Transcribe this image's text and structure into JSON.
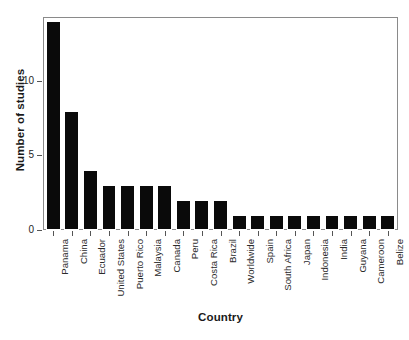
{
  "chart_data": {
    "type": "bar",
    "title": "",
    "xlabel": "Country",
    "ylabel": "Number of studies",
    "categories": [
      "Panama",
      "China",
      "Ecuador",
      "United States",
      "Puerto Rico",
      "Malaysia",
      "Canada",
      "Peru",
      "Costa Rica",
      "Brazil",
      "Worldwide",
      "Spain",
      "South Africa",
      "Japan",
      "Indonesia",
      "India",
      "Guyana",
      "Cameroon",
      "Belize"
    ],
    "values": [
      14,
      8,
      4,
      3,
      3,
      3,
      3,
      2,
      2,
      2,
      1,
      1,
      1,
      1,
      1,
      1,
      1,
      1,
      1
    ],
    "ylim": [
      0,
      14.2
    ],
    "yticks": [
      0,
      5,
      10
    ],
    "ytick_labels": [
      "0",
      "5",
      "10"
    ],
    "grid": false,
    "legend": null,
    "bar_color": "#0a0a0a",
    "frame_color": "#8a8a8a",
    "background": "#ffffff"
  }
}
